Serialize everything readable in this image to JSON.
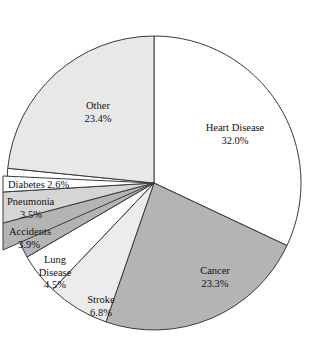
{
  "chart_data": {
    "type": "pie",
    "title": "",
    "xlabel": "",
    "ylabel": "",
    "legend": "none",
    "grid": false,
    "units": "percent",
    "start_angle_deg": 0,
    "direction": "clockwise",
    "categories": [
      "Heart Disease",
      "Cancer",
      "Stroke",
      "Lung Disease",
      "Accidents",
      "Pneumonia",
      "Diabetes",
      "Other"
    ],
    "values": [
      32.0,
      23.3,
      6.8,
      4.5,
      3.9,
      3.5,
      2.6,
      23.4
    ],
    "slices": [
      {
        "label": "Heart Disease",
        "value": 32.0,
        "value_text": "32.0%",
        "fill": "#ffffff",
        "label_lines": [
          "Heart Disease",
          "32.0%"
        ],
        "label_placement": "inside"
      },
      {
        "label": "Cancer",
        "value": 23.3,
        "value_text": "23.3%",
        "fill": "#b4b4b4",
        "label_lines": [
          "Cancer",
          "23.3%"
        ],
        "label_placement": "inside"
      },
      {
        "label": "Stroke",
        "value": 6.8,
        "value_text": "6.8%",
        "fill": "#ececec",
        "label_lines": [
          "Stroke",
          "6.8%"
        ],
        "label_placement": "inside"
      },
      {
        "label": "Lung Disease",
        "value": 4.5,
        "value_text": "4.5%",
        "fill": "#ffffff",
        "label_lines": [
          "Lung",
          "Disease",
          "4.5%"
        ],
        "label_placement": "inside"
      },
      {
        "label": "Accidents",
        "value": 3.9,
        "value_text": "3.9%",
        "fill": "#b4b4b4",
        "label_lines": [
          "Accidents",
          "3.9%"
        ],
        "label_placement": "callout"
      },
      {
        "label": "Pneumonia",
        "value": 3.5,
        "value_text": "3.5%",
        "fill": "#d5d5d5",
        "label_lines": [
          "Pneumonia",
          "3.5%"
        ],
        "label_placement": "callout"
      },
      {
        "label": "Diabetes",
        "value": 2.6,
        "value_text": "2.6%",
        "fill": "#ffffff",
        "label_lines": [
          "Diabetes 2.6%"
        ],
        "label_placement": "callout"
      },
      {
        "label": "Other",
        "value": 23.4,
        "value_text": "23.4%",
        "fill": "#e8e8e8",
        "label_lines": [
          "Other",
          "23.4%"
        ],
        "label_placement": "inside"
      }
    ],
    "colors": {
      "outline": "#3a3a3a",
      "background": "#ffffff",
      "text": "#111111"
    }
  },
  "labels": {
    "heart_disease_name": "Heart Disease",
    "heart_disease_pct": "32.0%",
    "cancer_name": "Cancer",
    "cancer_pct": "23.3%",
    "stroke_name": "Stroke",
    "stroke_pct": "6.8%",
    "lung_name": "Lung",
    "lung_name2": "Disease",
    "lung_pct": "4.5%",
    "accidents_name": "Accidents",
    "accidents_pct": "3.9%",
    "pneumonia_name": "Pneumonia",
    "pneumonia_pct": "3.5%",
    "diabetes_line": "Diabetes 2.6%",
    "other_name": "Other",
    "other_pct": "23.4%"
  }
}
